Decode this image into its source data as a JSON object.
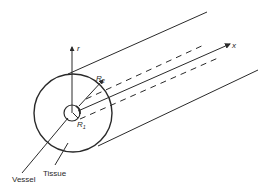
{
  "diagram": {
    "type": "cylindrical tissue-vessel geometry",
    "labels": {
      "r_axis": "r",
      "x_axis": "x",
      "r2": "R",
      "r2_sub": "2",
      "r1": "R",
      "r1_sub": "1",
      "vessel": "Vessel",
      "tissue": "Tissue"
    },
    "colors": {
      "line": "#2a2a2a",
      "background": "#ffffff"
    }
  }
}
